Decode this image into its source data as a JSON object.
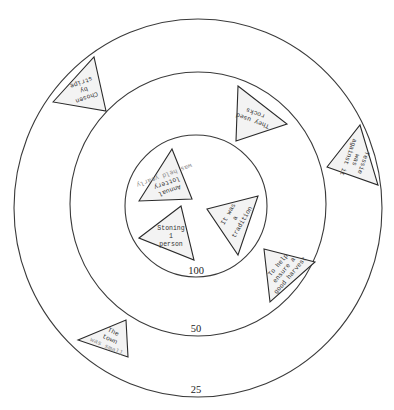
{
  "diagram": {
    "type": "concentric-rings",
    "rings": [
      {
        "label": "25",
        "cx": 198,
        "cy": 208,
        "rx": 184,
        "ry": 189,
        "label_x": 196,
        "label_y": 393
      },
      {
        "label": "50",
        "cx": 198,
        "cy": 204,
        "rx": 128,
        "ry": 132,
        "label_x": 196,
        "label_y": 332
      },
      {
        "label": "100",
        "cx": 196,
        "cy": 206,
        "rx": 71,
        "ry": 71,
        "label_x": 196,
        "label_y": 274
      }
    ],
    "cards": [
      {
        "id": "chosen-by-stripe",
        "ring": "25",
        "points": "53,102 94,57 106,111",
        "cx": 84,
        "cy": 90,
        "rotate": 160,
        "lines": [
          "Chosen",
          "by",
          "stripe"
        ],
        "muted_line": -1
      },
      {
        "id": "they-used-rocks",
        "ring": "50",
        "points": "238,86 287,124 236,141",
        "cx": 254,
        "cy": 117,
        "rotate": 200,
        "lines": [
          "They used",
          "rocks"
        ],
        "muted_line": -1
      },
      {
        "id": "tessie-was-against-it",
        "ring": "25",
        "points": "327,167 360,125 378,185",
        "cx": 356,
        "cy": 160,
        "rotate": 110,
        "lines": [
          "Tessie",
          "was",
          "against it"
        ],
        "muted_line": -1
      },
      {
        "id": "annual-lottery",
        "ring": "100",
        "points": "139,201 172,149 192,199",
        "cx": 167,
        "cy": 183,
        "rotate": 160,
        "lines": [
          "Annual",
          "lottery",
          "was held yearly"
        ],
        "muted_line": 2
      },
      {
        "id": "stoning-1-person",
        "ring": "100",
        "points": "139,238 181,206 194,260",
        "cx": 171,
        "cy": 236,
        "rotate": 0,
        "lines": [
          "Stoning",
          "1",
          "person"
        ],
        "muted_line": -1
      },
      {
        "id": "it-was-a-tradition",
        "ring": "100",
        "points": "207,209 258,196 238,255",
        "cx": 235,
        "cy": 218,
        "rotate": -60,
        "lines": [
          "It was",
          "a",
          "tradition"
        ],
        "muted_line": -1
      },
      {
        "id": "to-help-ensure-harvest",
        "ring": "50",
        "points": "264,249 315,262 270,302",
        "cx": 284,
        "cy": 270,
        "rotate": -50,
        "lines": [
          "To help",
          "ensure a",
          "good harvest"
        ],
        "muted_line": -1
      },
      {
        "id": "the-town-was-small",
        "ring": "25",
        "points": "78,340 126,320 128,357",
        "cx": 110,
        "cy": 339,
        "rotate": 25,
        "lines": [
          "The",
          "town",
          "was small"
        ],
        "muted_line": 2
      }
    ]
  }
}
